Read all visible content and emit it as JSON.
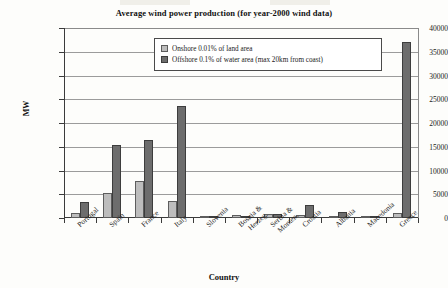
{
  "chart_data": {
    "type": "bar",
    "title": "Average wind power production (for year-2000 wind data)",
    "xlabel": "Country",
    "ylabel": "MW",
    "ylim": [
      0,
      40000
    ],
    "yticks": [
      0,
      5000,
      10000,
      15000,
      20000,
      25000,
      30000,
      35000,
      40000
    ],
    "ytick_labels": [
      "0",
      "5000",
      "10000",
      "15000",
      "20000",
      "25000",
      "30000",
      "35000",
      "40000"
    ],
    "grid": true,
    "legend_position": "top-center-inside",
    "categories": [
      "Portugal",
      "Spain",
      "France",
      "Italy",
      "Slovenia",
      "Bosnia &\nHerzeg.",
      "Serbia &\nMonten.",
      "Croatia",
      "Albania",
      "Macedonia",
      "Greece"
    ],
    "series": [
      {
        "name": "Onshore 0.01% of land area",
        "color": "#bdbdbd",
        "values": [
          1000,
          5200,
          7700,
          3600,
          200,
          600,
          900,
          700,
          350,
          100,
          1000
        ]
      },
      {
        "name": "Offshore 0.1% of water area (max 20km from coast)",
        "color": "#6d6d6d",
        "values": [
          3400,
          15300,
          16400,
          23500,
          150,
          250,
          950,
          2800,
          1200,
          200,
          37000
        ]
      }
    ]
  },
  "chart": {
    "title": "Average wind power production (for year-2000 wind data)",
    "y_axis_title": "MW",
    "x_axis_title": "Country"
  },
  "legend": {
    "items": [
      {
        "label": "Onshore 0.01% of land area",
        "swatch": "light-gray-swatch"
      },
      {
        "label": "Offshore 0.1% of water area (max 20km from coast)",
        "swatch": "dark-gray-swatch"
      }
    ]
  }
}
